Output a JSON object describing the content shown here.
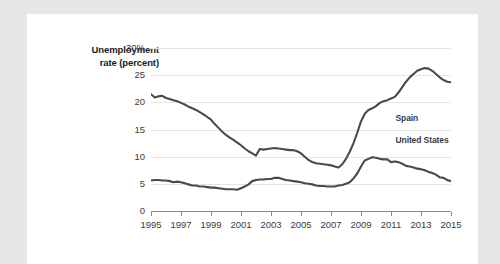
{
  "axis_title": {
    "line1": "Unemployment",
    "line2": "rate (percent)"
  },
  "labels": {
    "spain": "Spain",
    "united_states": "United States"
  },
  "colors": {
    "line": "#4a4a4a",
    "grid": "#e4e4e4",
    "axis": "#8a8a8a",
    "text": "#3b3b3b",
    "card": "#ffffff",
    "page_background": "#e7e7e7"
  },
  "chart_data": {
    "type": "line",
    "title": "",
    "xlabel": "",
    "ylabel": "Unemployment rate (percent)",
    "xlim": [
      1995,
      2015
    ],
    "ylim": [
      0,
      30
    ],
    "yticks": [
      0,
      5,
      10,
      15,
      20,
      25,
      30
    ],
    "ytick_labels": [
      "0",
      "5",
      "10",
      "15",
      "20",
      "25",
      "30%"
    ],
    "xticks": [
      1995,
      1997,
      1999,
      2001,
      2003,
      2005,
      2007,
      2009,
      2011,
      2013,
      2015
    ],
    "xtick_labels": [
      "1995",
      "1997",
      "1999",
      "2001",
      "2003",
      "2005",
      "2007",
      "2009",
      "2011",
      "2013",
      "2015"
    ],
    "grid": "horizontal",
    "legend": "inline-annotations",
    "series": [
      {
        "name": "Spain",
        "label_position": {
          "x": 2011.3,
          "y": 17.2
        },
        "x": [
          1995.0,
          1995.25,
          1995.5,
          1995.75,
          1996.0,
          1996.25,
          1996.5,
          1996.75,
          1997.0,
          1997.25,
          1997.5,
          1997.75,
          1998.0,
          1998.25,
          1998.5,
          1998.75,
          1999.0,
          1999.25,
          1999.5,
          1999.75,
          2000.0,
          2000.25,
          2000.5,
          2000.75,
          2001.0,
          2001.25,
          2001.5,
          2001.75,
          2002.0,
          2002.25,
          2002.5,
          2002.75,
          2003.0,
          2003.25,
          2003.5,
          2003.75,
          2004.0,
          2004.25,
          2004.5,
          2004.75,
          2005.0,
          2005.25,
          2005.5,
          2005.75,
          2006.0,
          2006.25,
          2006.5,
          2006.75,
          2007.0,
          2007.25,
          2007.5,
          2007.75,
          2008.0,
          2008.25,
          2008.5,
          2008.75,
          2009.0,
          2009.25,
          2009.5,
          2009.75,
          2010.0,
          2010.25,
          2010.5,
          2010.75,
          2011.0,
          2011.25,
          2011.5,
          2011.75,
          2012.0,
          2012.25,
          2012.5,
          2012.75,
          2013.0,
          2013.25,
          2013.5,
          2013.75,
          2014.0,
          2014.25,
          2014.5,
          2014.75,
          2015.0
        ],
        "y": [
          21.5,
          20.9,
          21.1,
          21.2,
          20.8,
          20.6,
          20.4,
          20.2,
          19.9,
          19.6,
          19.2,
          18.9,
          18.6,
          18.2,
          17.8,
          17.3,
          16.8,
          16.0,
          15.3,
          14.6,
          14.0,
          13.5,
          13.1,
          12.6,
          12.1,
          11.5,
          11.0,
          10.6,
          10.2,
          11.4,
          11.3,
          11.4,
          11.5,
          11.6,
          11.5,
          11.4,
          11.3,
          11.2,
          11.2,
          11.0,
          10.6,
          10.0,
          9.4,
          9.0,
          8.8,
          8.7,
          8.6,
          8.5,
          8.4,
          8.2,
          8.0,
          8.6,
          9.6,
          10.9,
          12.5,
          14.4,
          16.5,
          17.9,
          18.6,
          18.9,
          19.3,
          19.9,
          20.2,
          20.4,
          20.7,
          21.0,
          21.8,
          22.8,
          23.8,
          24.6,
          25.2,
          25.8,
          26.1,
          26.3,
          26.2,
          25.8,
          25.2,
          24.6,
          24.1,
          23.8,
          23.7
        ]
      },
      {
        "name": "United States",
        "label_position": {
          "x": 2011.3,
          "y": 13.0
        },
        "x": [
          1995.0,
          1995.25,
          1995.5,
          1995.75,
          1996.0,
          1996.25,
          1996.5,
          1996.75,
          1997.0,
          1997.25,
          1997.5,
          1997.75,
          1998.0,
          1998.25,
          1998.5,
          1998.75,
          1999.0,
          1999.25,
          1999.5,
          1999.75,
          2000.0,
          2000.25,
          2000.5,
          2000.75,
          2001.0,
          2001.25,
          2001.5,
          2001.75,
          2002.0,
          2002.25,
          2002.5,
          2002.75,
          2003.0,
          2003.25,
          2003.5,
          2003.75,
          2004.0,
          2004.25,
          2004.5,
          2004.75,
          2005.0,
          2005.25,
          2005.5,
          2005.75,
          2006.0,
          2006.25,
          2006.5,
          2006.75,
          2007.0,
          2007.25,
          2007.5,
          2007.75,
          2008.0,
          2008.25,
          2008.5,
          2008.75,
          2009.0,
          2009.25,
          2009.5,
          2009.75,
          2010.0,
          2010.25,
          2010.5,
          2010.75,
          2011.0,
          2011.25,
          2011.5,
          2011.75,
          2012.0,
          2012.25,
          2012.5,
          2012.75,
          2013.0,
          2013.25,
          2013.5,
          2013.75,
          2014.0,
          2014.25,
          2014.5,
          2014.75,
          2015.0
        ],
        "y": [
          5.6,
          5.7,
          5.7,
          5.6,
          5.6,
          5.5,
          5.3,
          5.4,
          5.3,
          5.1,
          4.9,
          4.7,
          4.7,
          4.5,
          4.5,
          4.4,
          4.3,
          4.3,
          4.2,
          4.1,
          4.0,
          4.0,
          4.0,
          3.9,
          4.2,
          4.5,
          4.9,
          5.5,
          5.7,
          5.8,
          5.8,
          5.9,
          5.9,
          6.1,
          6.1,
          5.9,
          5.7,
          5.6,
          5.5,
          5.4,
          5.3,
          5.1,
          5.0,
          4.9,
          4.7,
          4.6,
          4.6,
          4.5,
          4.5,
          4.5,
          4.7,
          4.8,
          5.0,
          5.3,
          6.0,
          6.9,
          8.2,
          9.3,
          9.6,
          9.9,
          9.8,
          9.6,
          9.5,
          9.5,
          9.0,
          9.1,
          9.0,
          8.7,
          8.3,
          8.2,
          8.0,
          7.8,
          7.7,
          7.5,
          7.2,
          7.0,
          6.7,
          6.2,
          6.1,
          5.7,
          5.5
        ]
      }
    ]
  }
}
